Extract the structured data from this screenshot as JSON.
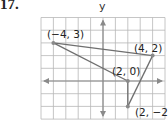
{
  "problem_number": "17.",
  "axes": {
    "y_label": "y",
    "x_range": [
      -5,
      5
    ],
    "y_range": [
      -3,
      5
    ]
  },
  "points": [
    {
      "label": "(−4, 3)",
      "x": -4,
      "y": 3
    },
    {
      "label": "(4, 2)",
      "x": 4,
      "y": 2
    },
    {
      "label": "(2, 0)",
      "x": 2,
      "y": 0
    },
    {
      "label": "(2, −2)",
      "x": 2,
      "y": -2
    }
  ],
  "segments": [
    [
      0,
      1
    ],
    [
      0,
      2
    ],
    [
      1,
      3
    ],
    [
      2,
      3
    ]
  ],
  "colors": {
    "grid": "#b8b8b8",
    "axis": "#8a8a8a",
    "line": "#6f6f6f",
    "point": "#8a8a8a"
  }
}
